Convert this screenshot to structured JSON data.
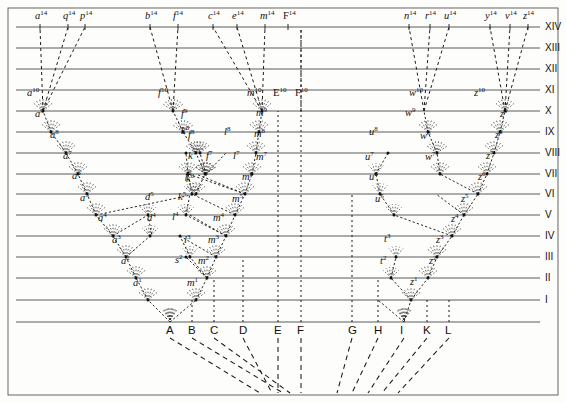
{
  "figure": {
    "colors": {
      "ink": "#1a1a1a",
      "rule": "#4d4d4d",
      "paper": "#fdfdfc"
    },
    "geometry": {
      "width": 566,
      "height": 403,
      "frame": {
        "x": 8,
        "y": 8,
        "w": 550,
        "h": 387
      },
      "baseline_y": 322,
      "row_y": {
        "XIV": 27,
        "XIII": 48,
        "XII": 69,
        "XI": 90,
        "X": 111,
        "IX": 132,
        "VIII": 153,
        "VII": 174,
        "VI": 194,
        "V": 215,
        "IV": 236,
        "III": 257,
        "II": 278,
        "I": 300
      },
      "rule_x0": 16,
      "rule_x1": 540
    },
    "roman_levels": [
      "XIV",
      "XIII",
      "XII",
      "XI",
      "X",
      "IX",
      "VIII",
      "VII",
      "VI",
      "V",
      "IV",
      "III",
      "II",
      "I"
    ],
    "baseline_species": [
      {
        "letter": "A",
        "x": 170
      },
      {
        "letter": "B",
        "x": 192
      },
      {
        "letter": "C",
        "x": 214
      },
      {
        "letter": "D",
        "x": 243
      },
      {
        "letter": "E",
        "x": 278
      },
      {
        "letter": "F",
        "x": 301
      },
      {
        "letter": "G",
        "x": 352
      },
      {
        "letter": "H",
        "x": 378
      },
      {
        "letter": "I",
        "x": 404
      },
      {
        "letter": "K",
        "x": 427
      },
      {
        "letter": "L",
        "x": 449
      }
    ],
    "top_labels": [
      {
        "text": "a",
        "sup": "14",
        "x": 40,
        "italic": true
      },
      {
        "text": "q",
        "sup": "14",
        "x": 68,
        "italic": true
      },
      {
        "text": "p",
        "sup": "14",
        "x": 85,
        "italic": true
      },
      {
        "text": "b",
        "sup": "14",
        "x": 150,
        "italic": true
      },
      {
        "text": "f",
        "sup": "14",
        "x": 178,
        "italic": true
      },
      {
        "text": "c",
        "sup": "14",
        "x": 213,
        "italic": true
      },
      {
        "text": "e",
        "sup": "14",
        "x": 237,
        "italic": true
      },
      {
        "text": "m",
        "sup": "14",
        "x": 265,
        "italic": true
      },
      {
        "text": "F",
        "sup": "14",
        "x": 288,
        "italic": false
      },
      {
        "text": "n",
        "sup": "14",
        "x": 409,
        "italic": true
      },
      {
        "text": "r",
        "sup": "14",
        "x": 430,
        "italic": true
      },
      {
        "text": "u",
        "sup": "14",
        "x": 449,
        "italic": true
      },
      {
        "text": "y",
        "sup": "14",
        "x": 490,
        "italic": true
      },
      {
        "text": "v",
        "sup": "14",
        "x": 510,
        "italic": true
      },
      {
        "text": "z",
        "sup": "14",
        "x": 528,
        "italic": true
      }
    ],
    "row_x_labels": [
      {
        "text": "a",
        "sup": "10",
        "x": 32,
        "y": 104,
        "italic": true
      },
      {
        "text": "f",
        "sup": "10",
        "x": 163,
        "y": 104,
        "italic": true
      },
      {
        "text": "m",
        "sup": "10",
        "x": 252,
        "y": 104,
        "italic": true
      },
      {
        "text": "E",
        "sup": "10",
        "x": 278,
        "y": 104,
        "italic": false
      },
      {
        "text": "F",
        "sup": "10",
        "x": 300,
        "y": 104,
        "italic": false
      },
      {
        "text": "w",
        "sup": "10",
        "x": 414,
        "y": 104,
        "italic": true
      },
      {
        "text": "z",
        "sup": "10",
        "x": 479,
        "y": 104,
        "italic": true
      }
    ],
    "node_labels": [
      {
        "text": "a",
        "sup": "9",
        "x": 40,
        "y": 125,
        "italic": true
      },
      {
        "text": "f",
        "sup": "9",
        "x": 186,
        "y": 125,
        "italic": true
      },
      {
        "text": "m",
        "sup": "9",
        "x": 261,
        "y": 124,
        "italic": true
      },
      {
        "text": "w",
        "sup": "9",
        "x": 410,
        "y": 124,
        "italic": true
      },
      {
        "text": "z",
        "sup": "9",
        "x": 505,
        "y": 125,
        "italic": true
      },
      {
        "text": "a",
        "sup": "8",
        "x": 55,
        "y": 146,
        "italic": true
      },
      {
        "text": "f",
        "sup": "8",
        "x": 193,
        "y": 146,
        "italic": true
      },
      {
        "text": "k",
        "sup": "8",
        "x": 186,
        "y": 142,
        "italic": true
      },
      {
        "text": "l",
        "sup": "8",
        "x": 229,
        "y": 143,
        "italic": true
      },
      {
        "text": "m",
        "sup": "8",
        "x": 259,
        "y": 145,
        "italic": true
      },
      {
        "text": "u",
        "sup": "8",
        "x": 374,
        "y": 143,
        "italic": true
      },
      {
        "text": "w",
        "sup": "8",
        "x": 425,
        "y": 147,
        "italic": true
      },
      {
        "text": "z",
        "sup": "8",
        "x": 500,
        "y": 146,
        "italic": true
      },
      {
        "text": "a",
        "sup": "7",
        "x": 68,
        "y": 167,
        "italic": true
      },
      {
        "text": "f",
        "sup": "7",
        "x": 211,
        "y": 167,
        "italic": true
      },
      {
        "text": "k",
        "sup": "7",
        "x": 193,
        "y": 167,
        "italic": true
      },
      {
        "text": "l",
        "sup": "7",
        "x": 238,
        "y": 167,
        "italic": true
      },
      {
        "text": "m",
        "sup": "7",
        "x": 261,
        "y": 168,
        "italic": true
      },
      {
        "text": "u",
        "sup": "7",
        "x": 370,
        "y": 168,
        "italic": true
      },
      {
        "text": "w",
        "sup": "7",
        "x": 430,
        "y": 168,
        "italic": true
      },
      {
        "text": "z",
        "sup": "7",
        "x": 491,
        "y": 167,
        "italic": true
      },
      {
        "text": "a",
        "sup": "6",
        "x": 77,
        "y": 187,
        "italic": true
      },
      {
        "text": "f",
        "sup": "6",
        "x": 190,
        "y": 187,
        "italic": true
      },
      {
        "text": "k",
        "sup": "6",
        "x": 191,
        "y": 190,
        "italic": true
      },
      {
        "text": "m",
        "sup": "6",
        "x": 247,
        "y": 188,
        "italic": true
      },
      {
        "text": "u",
        "sup": "6",
        "x": 374,
        "y": 188,
        "italic": true
      },
      {
        "text": "z",
        "sup": "6",
        "x": 483,
        "y": 188,
        "italic": true
      },
      {
        "text": "a",
        "sup": "5",
        "x": 85,
        "y": 209,
        "italic": true
      },
      {
        "text": "d",
        "sup": "5",
        "x": 150,
        "y": 208,
        "italic": true
      },
      {
        "text": "k",
        "sup": "5",
        "x": 183,
        "y": 208,
        "italic": true
      },
      {
        "text": "m",
        "sup": "5",
        "x": 237,
        "y": 210,
        "italic": true
      },
      {
        "text": "u",
        "sup": "5",
        "x": 380,
        "y": 210,
        "italic": true
      },
      {
        "text": "z",
        "sup": "5",
        "x": 466,
        "y": 210,
        "italic": true
      },
      {
        "text": "a",
        "sup": "4",
        "x": 103,
        "y": 229,
        "italic": true
      },
      {
        "text": "d",
        "sup": "4",
        "x": 152,
        "y": 229,
        "italic": true
      },
      {
        "text": "l",
        "sup": "4",
        "x": 177,
        "y": 228,
        "italic": true
      },
      {
        "text": "m",
        "sup": "4",
        "x": 218,
        "y": 229,
        "italic": true
      },
      {
        "text": "z",
        "sup": "4",
        "x": 456,
        "y": 230,
        "italic": true
      },
      {
        "text": "a",
        "sup": "3",
        "x": 117,
        "y": 251,
        "italic": true
      },
      {
        "text": "l",
        "sup": "3",
        "x": 189,
        "y": 251,
        "italic": true
      },
      {
        "text": "m",
        "sup": "3",
        "x": 213,
        "y": 251,
        "italic": true
      },
      {
        "text": "t",
        "sup": "3",
        "x": 389,
        "y": 250,
        "italic": true
      },
      {
        "text": "z",
        "sup": "3",
        "x": 441,
        "y": 251,
        "italic": true
      },
      {
        "text": "a",
        "sup": "2",
        "x": 126,
        "y": 272,
        "italic": true
      },
      {
        "text": "s",
        "sup": "2",
        "x": 180,
        "y": 271,
        "italic": true
      },
      {
        "text": "m",
        "sup": "2",
        "x": 203,
        "y": 272,
        "italic": true
      },
      {
        "text": "t",
        "sup": "2",
        "x": 385,
        "y": 272,
        "italic": true
      },
      {
        "text": "z",
        "sup": "2",
        "x": 434,
        "y": 272,
        "italic": true
      },
      {
        "text": "a",
        "sup": "1",
        "x": 138,
        "y": 294,
        "italic": true
      },
      {
        "text": "m",
        "sup": "1",
        "x": 192,
        "y": 294,
        "italic": true
      },
      {
        "text": "z",
        "sup": "1",
        "x": 415,
        "y": 293,
        "italic": true
      }
    ]
  }
}
